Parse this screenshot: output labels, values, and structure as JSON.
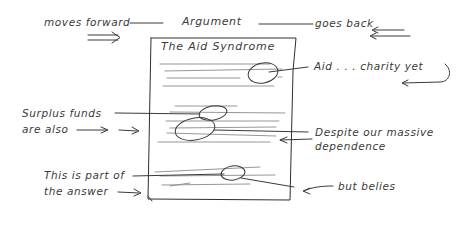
{
  "diagram": {
    "top": {
      "left_label": "moves forward",
      "center_label": "Argument",
      "right_label": "goes back"
    },
    "document": {
      "title": "The Aid Syndrome"
    },
    "annotations": {
      "aid_charity": "Aid . . . charity yet",
      "surplus_line1": "Surplus funds",
      "surplus_line2": "are also",
      "despite_line1": "Despite our massive",
      "despite_line2": "dependence",
      "answer_line1": "This is part of",
      "answer_line2": "the answer",
      "but_belies": "but belies"
    },
    "colors": {
      "ink": "#3a3a3a",
      "pencil": "#8a8a8a",
      "background": "#ffffff"
    }
  }
}
